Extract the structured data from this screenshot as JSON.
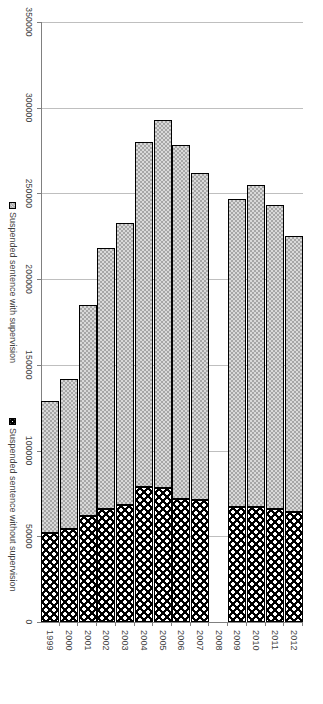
{
  "chart_data": {
    "type": "bar",
    "orientation": "horizontal-rotated",
    "stacked": true,
    "title": "",
    "xlabel": "",
    "ylabel": "",
    "categories": [
      "1999",
      "2000",
      "2001",
      "2002",
      "2003",
      "2004",
      "2005",
      "2006",
      "2007",
      "2008",
      "2009",
      "2010",
      "2011",
      "2012"
    ],
    "tick_labels": [
      "350000",
      "300000",
      "250000",
      "200000",
      "150000",
      "100000",
      "50000",
      "0"
    ],
    "ticks": [
      350000,
      300000,
      250000,
      200000,
      150000,
      100000,
      50000,
      0
    ],
    "xlim": [
      0,
      350000
    ],
    "grid": true,
    "legend_position": "bottom",
    "series": [
      {
        "name": "Suspended sentence without supervision",
        "fill": "black-with-white-dots",
        "color": "#000000",
        "values": [
          52000,
          54000,
          62000,
          66000,
          68000,
          79000,
          78000,
          72000,
          71000,
          null,
          67000,
          67000,
          66000,
          64000
        ]
      },
      {
        "name": "Suspended sentence with supervision",
        "fill": "gray-checker",
        "color": "#a6a6a6",
        "values": [
          77000,
          88000,
          123000,
          152000,
          165000,
          201000,
          215000,
          206000,
          191000,
          null,
          180000,
          188000,
          177000,
          161000
        ]
      }
    ],
    "totals": [
      129000,
      142000,
      185000,
      218000,
      233000,
      280000,
      293000,
      278000,
      262000,
      null,
      247000,
      255000,
      243000,
      225000
    ]
  },
  "legend": {
    "items": [
      {
        "label": "Suspended sentence with supervision",
        "swatch": "gray-checker-swatch"
      },
      {
        "label": "Suspended sentence without supervision",
        "swatch": "black-dotted-swatch"
      }
    ]
  },
  "colors": {
    "series_with_supervision": "#a6a6a6",
    "series_without_supervision": "#000000",
    "gridline": "#bfbfbf",
    "axis": "#808080",
    "text": "#3f3f3f",
    "background": "#ffffff"
  }
}
